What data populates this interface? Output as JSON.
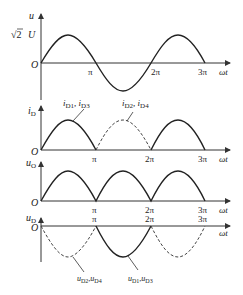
{
  "figure": {
    "x_ticks": [
      "π",
      "2π",
      "3π"
    ],
    "x_axis_label": "ωt",
    "origin_label": "O",
    "panels": [
      {
        "id": "input-voltage",
        "y_label": "u",
        "amplitude_label": "√2 U",
        "curve": "sine, 1.5 periods"
      },
      {
        "id": "diode-current",
        "y_label": "iD",
        "annotations": [
          "iD1, iD3",
          "iD2, iD4"
        ],
        "curve": "half-wave arcs, D2/D4 dashed"
      },
      {
        "id": "output-voltage",
        "y_label": "uO",
        "curve": "full-wave rectified"
      },
      {
        "id": "diode-voltage",
        "y_label": "uD",
        "annotations": [
          "uD2,uD4",
          "uD1,uD3"
        ],
        "curve": "negative arcs, D2/D4 dashed"
      }
    ]
  },
  "labels": {
    "u": "u",
    "amp_sqrt": "√2",
    "amp_u": "U",
    "O": "O",
    "pi": "π",
    "two_pi": "2π",
    "three_pi": "3π",
    "wt": "ωt",
    "iD_main": "i",
    "iD_sub": "D",
    "uO_main": "u",
    "uO_sub": "O",
    "uD_main": "u",
    "uD_sub": "D",
    "i_d13_a": "i",
    "i_d13_a_sub": "D1",
    "i_d13_sep": ", ",
    "i_d13_b": "i",
    "i_d13_b_sub": "D3",
    "i_d24_a": "i",
    "i_d24_a_sub": "D2",
    "i_d24_sep": ", ",
    "i_d24_b": "i",
    "i_d24_b_sub": "D4",
    "u_d24_a": "u",
    "u_d24_a_sub": "D2",
    "u_d24_sep": ",",
    "u_d24_b": "u",
    "u_d24_b_sub": "D4",
    "u_d13_a": "u",
    "u_d13_a_sub": "D1",
    "u_d13_sep": ",",
    "u_d13_b": "u",
    "u_d13_b_sub": "D3"
  }
}
